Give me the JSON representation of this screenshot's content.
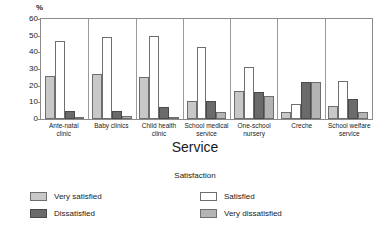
{
  "chart_data": {
    "type": "bar",
    "title": "",
    "xlabel": "Service",
    "ylabel": "%",
    "ylim": [
      0,
      60
    ],
    "yticks": [
      0,
      10,
      20,
      30,
      40,
      50,
      60
    ],
    "grid": false,
    "legend_position": "bottom",
    "legend_title": "Satisfaction",
    "categories": [
      "Ante-natal clinic",
      "Baby clinics",
      "Child health clinic",
      "School medical service",
      "One-school nursery",
      "Creche",
      "School welfare service"
    ],
    "series": [
      {
        "name": "Very satisfied",
        "color": "#c8c8c8",
        "values": [
          26,
          27,
          25,
          11,
          17,
          4,
          8
        ]
      },
      {
        "name": "Satisfied",
        "color": "#ffffff",
        "values": [
          47,
          49,
          50,
          43,
          31,
          9,
          23
        ]
      },
      {
        "name": "Dissatisfied",
        "color": "#6b6b6b",
        "values": [
          5,
          5,
          7,
          11,
          16,
          22,
          12
        ]
      },
      {
        "name": "Very dissatisfied",
        "color": "#b4b4b4",
        "values": [
          1,
          2,
          1,
          4,
          14,
          22,
          4
        ]
      }
    ]
  },
  "axis": {
    "y_unit": "%",
    "x_title": "Service"
  },
  "legend": {
    "title": "Satisfaction",
    "entries": [
      {
        "label": "Very satisfied",
        "series": 0
      },
      {
        "label": "Satisfied",
        "series": 1
      },
      {
        "label": "Dissatisfied",
        "series": 2
      },
      {
        "label": "Very dissatisfied",
        "series": 3
      }
    ]
  }
}
